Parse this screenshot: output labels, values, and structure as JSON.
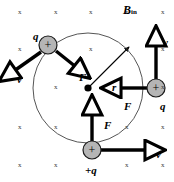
{
  "figure": {
    "name": "charged-particle-circular-motion-magnetic-field",
    "field_label": {
      "symbol": "B",
      "subscript": "in"
    },
    "field_marks": {
      "glyph": "x",
      "positions": [
        [
          20,
          13
        ],
        [
          56,
          13
        ],
        [
          91,
          13
        ],
        [
          127,
          13
        ],
        [
          163,
          13
        ],
        [
          20,
          50
        ],
        [
          91,
          50
        ],
        [
          127,
          50
        ],
        [
          163,
          50
        ],
        [
          56,
          88
        ],
        [
          163,
          88
        ],
        [
          20,
          128
        ],
        [
          56,
          128
        ],
        [
          127,
          128
        ],
        [
          163,
          128
        ],
        [
          20,
          166
        ],
        [
          56,
          166
        ],
        [
          127,
          166
        ],
        [
          163,
          166
        ]
      ]
    },
    "orbit": {
      "cx": 88,
      "cy": 88,
      "r": 55,
      "stroke": "#555555"
    },
    "center_dot": {
      "cx": 88,
      "cy": 88,
      "r": 3.6
    },
    "radius_arrow": {
      "label": "r",
      "label_pos": [
        112,
        82
      ],
      "from": [
        88,
        88
      ],
      "to": [
        129,
        47
      ]
    },
    "charges": [
      {
        "id": "charge-top-left",
        "label": "q",
        "label_pos": [
          33,
          31
        ],
        "cx": 48,
        "cy": 45,
        "r": 9,
        "sign": "+",
        "fill": "#b5b5b5",
        "velocity": {
          "label": "v",
          "label_pos": [
            17,
            74
          ],
          "from": [
            41,
            52
          ],
          "to": [
            14,
            71
          ]
        },
        "force": {
          "label": "F",
          "label_pos": [
            79,
            72
          ],
          "from": [
            56,
            51
          ],
          "to": [
            76,
            67
          ]
        }
      },
      {
        "id": "charge-right",
        "label": "q",
        "label_pos": [
          160,
          101
        ],
        "cx": 156,
        "cy": 88,
        "r": 9,
        "sign": "+",
        "fill": "#b5b5b5",
        "velocity": {
          "label": "v",
          "label_pos": [
            163,
            37
          ],
          "from": [
            156,
            79
          ],
          "to": [
            156,
            44
          ]
        },
        "force": {
          "label": "F",
          "label_pos": [
            124,
            101
          ],
          "from": [
            147,
            88
          ],
          "to": [
            119,
            88
          ]
        }
      },
      {
        "id": "charge-bottom",
        "label": "+q",
        "label_pos": [
          85,
          165
        ],
        "cx": 92,
        "cy": 150,
        "r": 9,
        "sign": "+",
        "fill": "#b5b5b5",
        "velocity": {
          "label": "v",
          "label_pos": [
            156,
            149
          ],
          "from": [
            101,
            150
          ],
          "to": [
            147,
            150
          ]
        },
        "force": {
          "label": "F",
          "label_pos": [
            104,
            120
          ],
          "from": [
            92,
            141
          ],
          "to": [
            92,
            113
          ]
        }
      }
    ]
  }
}
